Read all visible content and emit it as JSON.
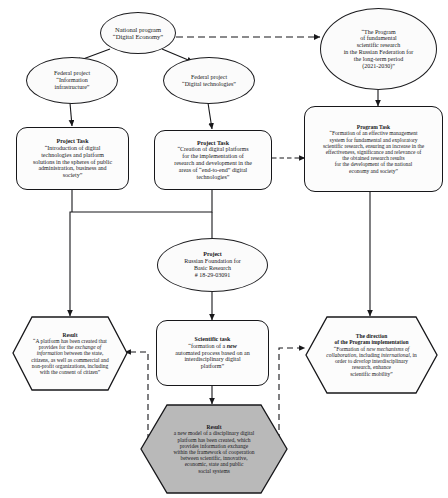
{
  "diagram": {
    "colors": {
      "stroke": "#17171a",
      "node_fill": "#fcfcfc",
      "highlight_fill": "#b9b9b9",
      "background": "#ffffff"
    },
    "nodes": {
      "national_program": {
        "shape": "ellipse",
        "line1": "National program",
        "line2": "“Digital Economy”"
      },
      "program_fundamental": {
        "shape": "ellipse",
        "line1": "“The Program",
        "line2": "of fundamental",
        "line3": "scientific research",
        "line4": "in the Russian Federation for",
        "line5": "the long-term  period",
        "line6": "(2021-2030)”"
      },
      "federal_info": {
        "shape": "ellipse",
        "line1": "Federal project",
        "line2": "“Information",
        "line3": "infrastructure”"
      },
      "federal_digital": {
        "shape": "ellipse",
        "line1": "Federal project",
        "line2": "“Digital technologies”"
      },
      "project_task_left": {
        "shape": "rounded-rect",
        "heading": "Project Task",
        "line1": "“Introduction of digital",
        "line2": "technologies and platform",
        "line3": "solutions in the spheres of public",
        "line4": "administration, business and",
        "line5": "society”"
      },
      "project_task_center": {
        "shape": "rounded-rect",
        "heading": "Project Task",
        "line1": "“Creation of digital platforms",
        "line2": "for the implementation of",
        "line3": "research and development in the",
        "line4": "areas of “end-to-end” digital",
        "line5": "technologies”"
      },
      "program_task_right": {
        "shape": "rounded-rect",
        "heading": "Program Task",
        "line1": "“Formation of an effective management",
        "line2": "system for fundamental and exploratory",
        "line3": "scientific research, ensuring an increase in the",
        "line4": "effectiveness, significance and relevance of",
        "line5": "the obtained research results",
        "line6": "for the development of the national",
        "line7": "economy and society”"
      },
      "project_rfbr": {
        "shape": "ellipse",
        "line1": "Project",
        "line2": "Russian Foundation for",
        "line3": "Basic Research",
        "line4": "# 18-29-03091"
      },
      "result_left": {
        "shape": "hexagon",
        "heading": "Result",
        "line1": "“A platform has been created that",
        "line2a": "provides for the ",
        "line2b": "exchange of",
        "line3a": "information",
        "line3b": " between the state,",
        "line4": "citizens, as well as commercial and",
        "line5": "non-profit organizations, including",
        "line6": "with the consent of citizen”"
      },
      "scientific_task": {
        "shape": "rounded-rect",
        "heading": "Scientific task",
        "line1a": "“formation of a ",
        "line1b": "new",
        "line2": "automated process based on an",
        "line3": "interdisciplinary digital",
        "line4": "platform”"
      },
      "direction_right": {
        "shape": "hexagon",
        "heading1": "The direction",
        "heading2": "of the Program implementation",
        "line1a": "“Formation of ",
        "line1b": "new mechanisms of",
        "line2a": "collaboration",
        "line2b": ", including ",
        "line2c": "international",
        "line2d": ", in",
        "line3a": "order to ",
        "line3b": "develop",
        "line3c": " interdisciplinary",
        "line4": "research, enhance",
        "line5": "scientific mobility”"
      },
      "result_bottom": {
        "shape": "hexagon",
        "highlighted": true,
        "heading": "Result",
        "line1": "a new model of a disciplinary digital",
        "line2": "platform has been created, which",
        "line3": "provides information exchange",
        "line4": "within the framework of cooperation",
        "line5": "between scientific, innovative,",
        "line6": "economic, state and public",
        "line7": "social systems"
      }
    },
    "edges": [
      {
        "name": "national-program-to-program-fundamental",
        "style": "dashed",
        "arrow": true
      },
      {
        "name": "national-program-to-federal-info",
        "style": "solid",
        "arrow": true
      },
      {
        "name": "national-program-to-federal-digital",
        "style": "solid",
        "arrow": true
      },
      {
        "name": "federal-info-to-project-task-left",
        "style": "solid",
        "arrow": true
      },
      {
        "name": "federal-digital-to-project-task-center",
        "style": "solid",
        "arrow": true
      },
      {
        "name": "program-fundamental-to-program-task-right",
        "style": "solid",
        "arrow": true
      },
      {
        "name": "project-task-center-to-program-task-right",
        "style": "dashed",
        "arrow": true
      },
      {
        "name": "project-tasks-to-result-left",
        "style": "solid",
        "arrow": true
      },
      {
        "name": "project-task-center-to-project-rfbr",
        "style": "solid",
        "arrow": false
      },
      {
        "name": "project-rfbr-to-scientific-task",
        "style": "solid",
        "arrow": true
      },
      {
        "name": "program-task-right-to-direction-right",
        "style": "solid",
        "arrow": true
      },
      {
        "name": "scientific-task-to-result-bottom",
        "style": "solid",
        "arrow": true
      },
      {
        "name": "result-bottom-to-result-left",
        "style": "dashed",
        "arrow": true
      },
      {
        "name": "result-bottom-to-direction-right",
        "style": "dashed",
        "arrow": true
      }
    ]
  }
}
